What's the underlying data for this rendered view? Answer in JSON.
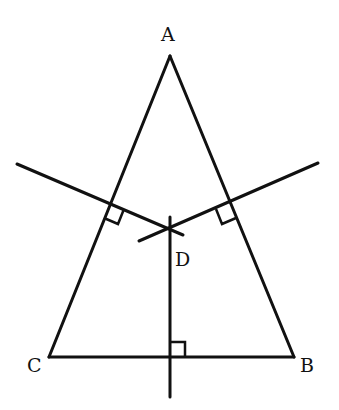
{
  "diagram": {
    "type": "geometry",
    "labels": {
      "A": "A",
      "B": "B",
      "C": "C",
      "D": "D"
    },
    "vertices": {
      "A": [
        170,
        56
      ],
      "B": [
        294,
        357
      ],
      "C": [
        49,
        357
      ],
      "D": [
        169,
        228
      ]
    },
    "right_angle_marks": 3,
    "stroke_color": "#111111"
  }
}
